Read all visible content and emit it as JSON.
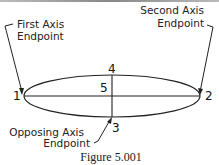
{
  "labels": {
    "first_axis_line1": "First Axis",
    "first_axis_line2": "Endpoint",
    "second_axis_line1": "Second Axis",
    "second_axis_line2": "Endpoint",
    "opposing_axis_line1": "Opposing Axis",
    "opposing_axis_line2": "Endpoint"
  },
  "points": {
    "p1": "1",
    "p2": "2",
    "p3": "3",
    "p4": "4",
    "p5": "5"
  },
  "caption": "Figure 5.001"
}
